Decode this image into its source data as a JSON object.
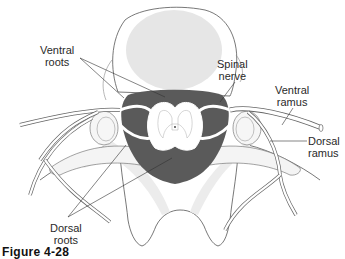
{
  "figure": {
    "caption": "Figure 4-28"
  },
  "labels": {
    "ventral_roots": {
      "line1": "Ventral",
      "line2": "roots"
    },
    "spinal_nerve": {
      "line1": "Spinal",
      "line2": "nerve"
    },
    "ventral_ramus": {
      "line1": "Ventral",
      "line2": "ramus"
    },
    "dorsal_ramus": {
      "line1": "Dorsal",
      "line2": "ramus"
    },
    "dorsal_roots": {
      "line1": "Dorsal",
      "line2": "roots"
    }
  },
  "colors": {
    "outline": "#555555",
    "vertebral_body_fill": "#e6e6e6",
    "shadow_fill": "#ededed",
    "dura_fill": "#5a5a5a",
    "grey_matter_fill": "#ffffff",
    "leader_line": "#333333"
  }
}
